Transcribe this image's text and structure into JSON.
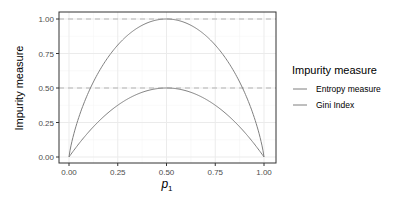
{
  "chart_data": {
    "type": "line",
    "title": "",
    "xlabel": "p1",
    "xlabel_main": "p",
    "xlabel_sub": "1",
    "ylabel": "Impurity measure",
    "xlim": [
      0,
      1
    ],
    "ylim": [
      0,
      1
    ],
    "x_ticks": [
      0,
      0.25,
      0.5,
      0.75,
      1.0
    ],
    "x_tick_labels": [
      "0.00",
      "0.25",
      "0.50",
      "0.75",
      "1.00"
    ],
    "y_ticks": [
      0,
      0.25,
      0.5,
      0.75,
      1.0
    ],
    "y_tick_labels": [
      "0.00",
      "0.25",
      "0.50",
      "0.75",
      "1.00"
    ],
    "grid": true,
    "reference_lines": [
      {
        "y": 1.0,
        "style": "dashed"
      },
      {
        "y": 0.5,
        "style": "dashed"
      }
    ],
    "legend": {
      "title": "Impurity measure",
      "position": "right",
      "entries": [
        "Entropy measure",
        "Gini Index"
      ]
    },
    "x": [
      0,
      0.05,
      0.1,
      0.15,
      0.2,
      0.25,
      0.3,
      0.35,
      0.4,
      0.45,
      0.5,
      0.55,
      0.6,
      0.65,
      0.7,
      0.75,
      0.8,
      0.85,
      0.9,
      0.95,
      1
    ],
    "series": [
      {
        "name": "Entropy measure",
        "color": "#7f7f7f",
        "values": [
          0,
          0.286,
          0.469,
          0.61,
          0.722,
          0.811,
          0.881,
          0.934,
          0.971,
          0.993,
          1.0,
          0.993,
          0.971,
          0.934,
          0.881,
          0.811,
          0.722,
          0.61,
          0.469,
          0.286,
          0
        ]
      },
      {
        "name": "Gini Index",
        "color": "#7f7f7f",
        "values": [
          0,
          0.095,
          0.18,
          0.255,
          0.32,
          0.375,
          0.42,
          0.455,
          0.48,
          0.495,
          0.5,
          0.495,
          0.48,
          0.455,
          0.42,
          0.375,
          0.32,
          0.255,
          0.18,
          0.095,
          0
        ]
      }
    ]
  }
}
